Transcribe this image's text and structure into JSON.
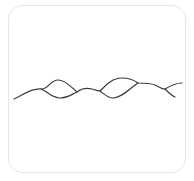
{
  "diagram": {
    "kind": "braided-wave-strands",
    "frame": {
      "border_color": "#e6e6e6",
      "background": "#ffffff",
      "corner_radius": 14
    },
    "stroke": {
      "color": "#3a3a3a",
      "width": 1.2
    },
    "strands": [
      {
        "name": "strand-a",
        "path": "M14,99 C22,96 30,88 41,89 C48,90 50,80 58,80 C66,80 72,88 77,92 C82,88 88,88 92,89 C96,90 98,91 100,91 C106,85 112,78 122,78 C130,78 134,80 138,83 C144,83 150,83 155,85 C159,87 162,89 165,89 C170,86 176,83 182,83"
      },
      {
        "name": "strand-b",
        "path": "M41,89 C48,92 52,98 60,98 C68,98 72,94 77,92 M100,91 C104,94 108,98 113,98 C122,98 130,88 138,83 M165,89 C168,92 172,96 175,97"
      }
    ],
    "crossings": [
      {
        "x": 41,
        "y": 89
      },
      {
        "x": 77,
        "y": 92
      },
      {
        "x": 100,
        "y": 91
      },
      {
        "x": 138,
        "y": 83
      },
      {
        "x": 165,
        "y": 89
      }
    ]
  }
}
